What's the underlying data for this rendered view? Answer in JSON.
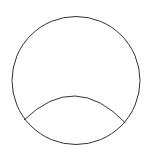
{
  "diagram": {
    "background": "#ffffff",
    "stroke_color": "#333333",
    "stroke_width": 1,
    "circle": {
      "cx": 76,
      "cy": 80.5,
      "r": 64
    },
    "arc": {
      "start": {
        "x": 24,
        "y": 120
      },
      "end": {
        "x": 125.5,
        "y": 123
      },
      "peak": {
        "x": 75,
        "y": 96
      }
    }
  }
}
